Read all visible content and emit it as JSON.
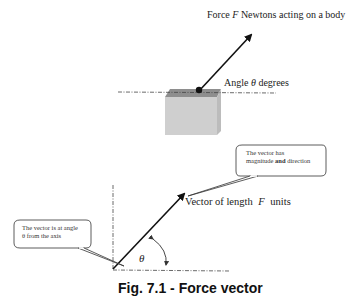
{
  "figure": {
    "top": {
      "force_label_prefix": "Force ",
      "force_symbol": "F",
      "force_label_suffix": " Newtons acting on a body",
      "angle_label_prefix": "Angle ",
      "angle_symbol": "θ",
      "angle_label_suffix": " degrees"
    },
    "bottom": {
      "vector_label_prefix": "Vector of length ",
      "vector_symbol": "F",
      "vector_label_suffix": " units",
      "callout_right_line1": "The vector has",
      "callout_right_line2_a": "magnitude ",
      "callout_right_line2_b": "and",
      "callout_right_line2_c": " direction",
      "callout_left_line1": "The vector is at angle",
      "callout_left_line2": "θ from the axis",
      "theta": "θ"
    },
    "caption": "Fig. 7.1 - Force vector"
  },
  "colors": {
    "line": "#111111",
    "box_top": "#8a8a8a",
    "box_front": "#cfcfcf",
    "box_side": "#bdbdbd"
  }
}
